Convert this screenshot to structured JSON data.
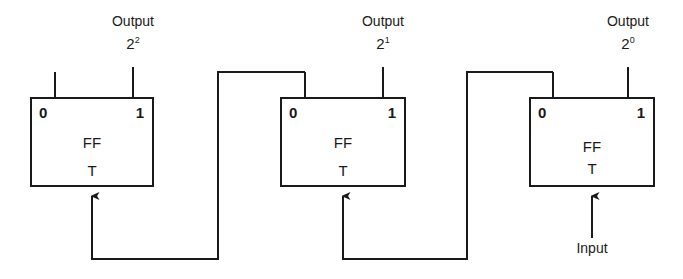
{
  "figure": {
    "width": 683,
    "height": 279,
    "background": "#ffffff",
    "line_color": "#1a1a1a",
    "line_width": 2
  },
  "stages": [
    {
      "id": "stage-msb",
      "ff_label": "FF",
      "type_label": "T",
      "terminal_left": "0",
      "terminal_right": "1",
      "output_word": "Output",
      "output_base": "2",
      "output_exponent": "2",
      "box": {
        "x": 30,
        "y": 97,
        "width": 124,
        "height": 90
      }
    },
    {
      "id": "stage-middle",
      "ff_label": "FF",
      "type_label": "T",
      "terminal_left": "0",
      "terminal_right": "1",
      "output_word": "Output",
      "output_base": "2",
      "output_exponent": "1",
      "box": {
        "x": 280,
        "y": 97,
        "width": 126,
        "height": 90
      }
    },
    {
      "id": "stage-lsb",
      "ff_label": "FF",
      "type_label": "T",
      "terminal_left": "0",
      "terminal_right": "1",
      "output_word": "Output",
      "output_base": "2",
      "output_exponent": "0",
      "box": {
        "x": 529,
        "y": 97,
        "width": 126,
        "height": 90
      }
    }
  ],
  "input": {
    "label": "Input"
  }
}
